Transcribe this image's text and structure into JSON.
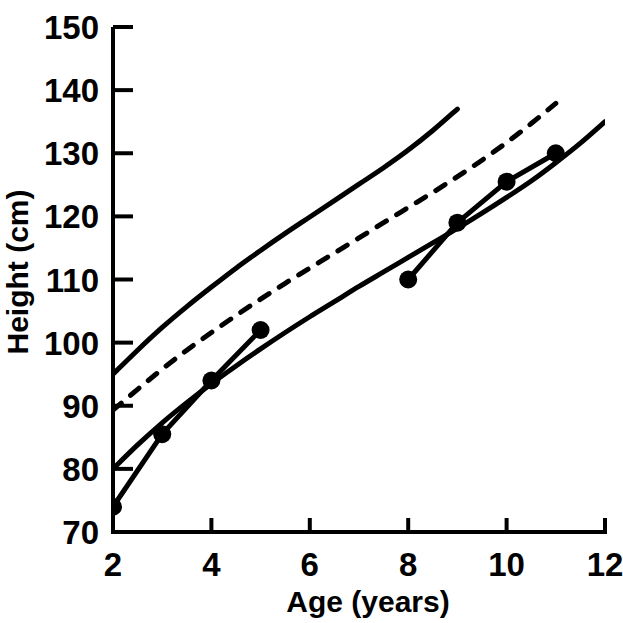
{
  "chart_data": {
    "type": "line",
    "title": "",
    "xlabel": "Age (years)",
    "ylabel": "Height (cm)",
    "xlim": [
      2,
      12
    ],
    "ylim": [
      70,
      150
    ],
    "xticks": [
      2,
      4,
      6,
      8,
      10,
      12
    ],
    "xtick_labels": [
      "2",
      "4",
      "6",
      "8",
      "10",
      "12"
    ],
    "yticks": [
      70,
      80,
      90,
      100,
      110,
      120,
      130,
      140,
      150
    ],
    "ytick_labels": [
      "70",
      "80",
      "90",
      "100",
      "110",
      "120",
      "130",
      "140",
      "150"
    ],
    "grid": false,
    "legend": "none",
    "series": [
      {
        "name": "upper reference centile",
        "style": "solid",
        "markers": false,
        "x": [
          2,
          2.5,
          3,
          3.5,
          4,
          4.5,
          5,
          5.5,
          6,
          6.5,
          7,
          7.5,
          8,
          8.5,
          9
        ],
        "y": [
          95.0,
          98.8,
          102.4,
          105.7,
          108.8,
          111.8,
          114.6,
          117.3,
          119.9,
          122.5,
          125.1,
          127.7,
          130.5,
          133.6,
          137.0
        ]
      },
      {
        "name": "middle reference centile (dashed)",
        "style": "dashed",
        "markers": false,
        "x": [
          2,
          2.5,
          3,
          3.5,
          4,
          4.5,
          5,
          5.5,
          6,
          6.5,
          7,
          7.5,
          8,
          8.5,
          9,
          9.5,
          10,
          10.5,
          11
        ],
        "y": [
          89.3,
          92.6,
          95.8,
          98.8,
          101.6,
          104.3,
          106.9,
          109.4,
          111.8,
          114.2,
          116.6,
          119.0,
          121.4,
          123.8,
          126.3,
          128.9,
          131.7,
          134.7,
          137.9
        ]
      },
      {
        "name": "lower reference centile",
        "style": "solid",
        "markers": false,
        "x": [
          2,
          2.5,
          3,
          3.5,
          4,
          4.5,
          5,
          5.5,
          6,
          6.5,
          7,
          7.5,
          8,
          8.5,
          9,
          9.5,
          10,
          10.5,
          11,
          11.5,
          12
        ],
        "y": [
          80.0,
          83.8,
          87.3,
          90.5,
          93.5,
          96.3,
          99.0,
          101.6,
          104.1,
          106.5,
          108.9,
          111.2,
          113.5,
          115.8,
          118.1,
          120.5,
          123.0,
          125.6,
          128.5,
          131.6,
          135.0
        ]
      },
      {
        "name": "patient measurements",
        "style": "solid",
        "markers": true,
        "x": [
          2,
          3,
          4,
          5
        ],
        "y": [
          74,
          85.5,
          94,
          102
        ]
      },
      {
        "name": "patient measurements (later)",
        "style": "solid",
        "markers": true,
        "x": [
          8,
          9,
          10,
          11
        ],
        "y": [
          110,
          119,
          125.5,
          130
        ]
      }
    ]
  },
  "figure": {
    "caption": ""
  }
}
